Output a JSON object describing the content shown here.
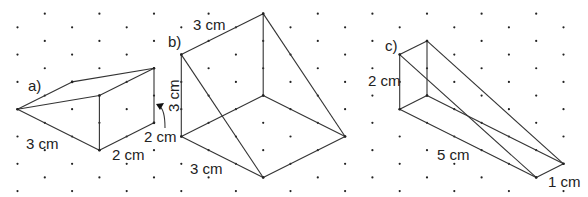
{
  "grid": {
    "origin_x": 17.5,
    "col_spacing": 27.3,
    "row_half_spacing": 13.65,
    "cols": 22,
    "rows": 15,
    "dot_color": "#222222"
  },
  "shapes": [
    {
      "id": "a",
      "label": "a)",
      "label_pos": [
        28,
        91
      ],
      "vertices": {
        "apex": [
          17.5,
          109.2
        ],
        "top_left": [
          72.1,
          81.9
        ],
        "top_back": [
          154,
          68.25
        ],
        "top_front": [
          99.4,
          95.55
        ],
        "bottom_front": [
          99.4,
          150.15
        ],
        "bottom_back": [
          154,
          122.85
        ]
      },
      "edges": [
        [
          "apex",
          "top_left"
        ],
        [
          "top_left",
          "top_back"
        ],
        [
          "apex",
          "top_front"
        ],
        [
          "top_front",
          "top_back"
        ],
        [
          "top_front",
          "bottom_front"
        ],
        [
          "apex",
          "bottom_front"
        ],
        [
          "bottom_front",
          "bottom_back"
        ],
        [
          "top_back",
          "bottom_back"
        ]
      ],
      "dimensions": [
        {
          "text": "3 cm",
          "pos": [
            26,
            149
          ]
        },
        {
          "text": "2 cm",
          "pos": [
            112,
            160
          ]
        },
        {
          "text": "2 cm",
          "pos": [
            144,
            142
          ]
        }
      ]
    },
    {
      "id": "b",
      "label": "b)",
      "label_pos": [
        168,
        47
      ],
      "vertices": {
        "tl": [
          181.3,
          54.6
        ],
        "top": [
          263.2,
          13.65
        ],
        "mid": [
          263.2,
          95.55
        ],
        "bl": [
          181.3,
          136.5
        ],
        "bottom": [
          263.2,
          177.45
        ],
        "right": [
          345.1,
          136.5
        ]
      },
      "edges": [
        [
          "tl",
          "top"
        ],
        [
          "top",
          "mid"
        ],
        [
          "top",
          "right"
        ],
        [
          "tl",
          "bl"
        ],
        [
          "tl",
          "bottom"
        ],
        [
          "bl",
          "mid"
        ],
        [
          "mid",
          "right"
        ],
        [
          "bl",
          "bottom"
        ],
        [
          "bottom",
          "right"
        ]
      ],
      "dimensions": [
        {
          "text": "3 cm",
          "pos": [
            193,
            30
          ]
        },
        {
          "text": "3 cm",
          "pos": [
            190,
            174
          ],
          "rotate": 0
        },
        {
          "text": "3 cm",
          "pos": [
            179,
            112
          ],
          "rotate": -90
        }
      ]
    },
    {
      "id": "c",
      "label": "c)",
      "label_pos": [
        385,
        51
      ],
      "vertices": {
        "tl": [
          399.7,
          54.6
        ],
        "tr": [
          427,
          40.95
        ],
        "bl": [
          399.7,
          109.2
        ],
        "br": [
          427,
          95.55
        ],
        "far_r": [
          563.5,
          163.8
        ],
        "far_l": [
          536.2,
          177.45
        ]
      },
      "edges": [
        [
          "tl",
          "tr"
        ],
        [
          "tr",
          "br"
        ],
        [
          "tl",
          "bl"
        ],
        [
          "bl",
          "br"
        ],
        [
          "tr",
          "far_r"
        ],
        [
          "tl",
          "far_l"
        ],
        [
          "bl",
          "far_l"
        ],
        [
          "br",
          "far_r"
        ],
        [
          "far_l",
          "far_r"
        ]
      ],
      "dimensions": [
        {
          "text": "2 cm",
          "pos": [
            368,
            86
          ]
        },
        {
          "text": "5 cm",
          "pos": [
            437,
            160
          ]
        },
        {
          "text": "1 cm",
          "pos": [
            548,
            187
          ]
        }
      ]
    }
  ],
  "arrow": {
    "from": [
      165,
      128
    ],
    "to": [
      156,
      104
    ],
    "meaning": "points 2 cm label to vertical edge"
  }
}
